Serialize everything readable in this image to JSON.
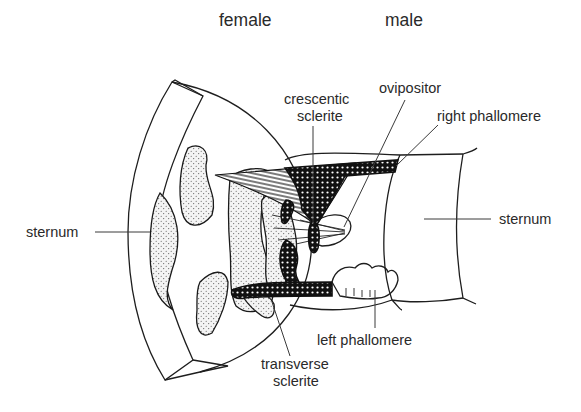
{
  "headers": {
    "female": "female",
    "male": "male"
  },
  "labels": {
    "sternum_left": "sternum",
    "sternum_right": "sternum",
    "crescentic_sclerite_line1": "crescentic",
    "crescentic_sclerite_line2": "sclerite",
    "ovipositor": "ovipositor",
    "right_phallomere": "right phallomere",
    "left_phallomere": "left phallomere",
    "transverse_sclerite_line1": "transverse",
    "transverse_sclerite_line2": "sclerite"
  },
  "colors": {
    "ink": "#1e1e1e",
    "text": "#2a2a2a",
    "background": "#ffffff",
    "stipple_fill": "#f4f4f4"
  }
}
